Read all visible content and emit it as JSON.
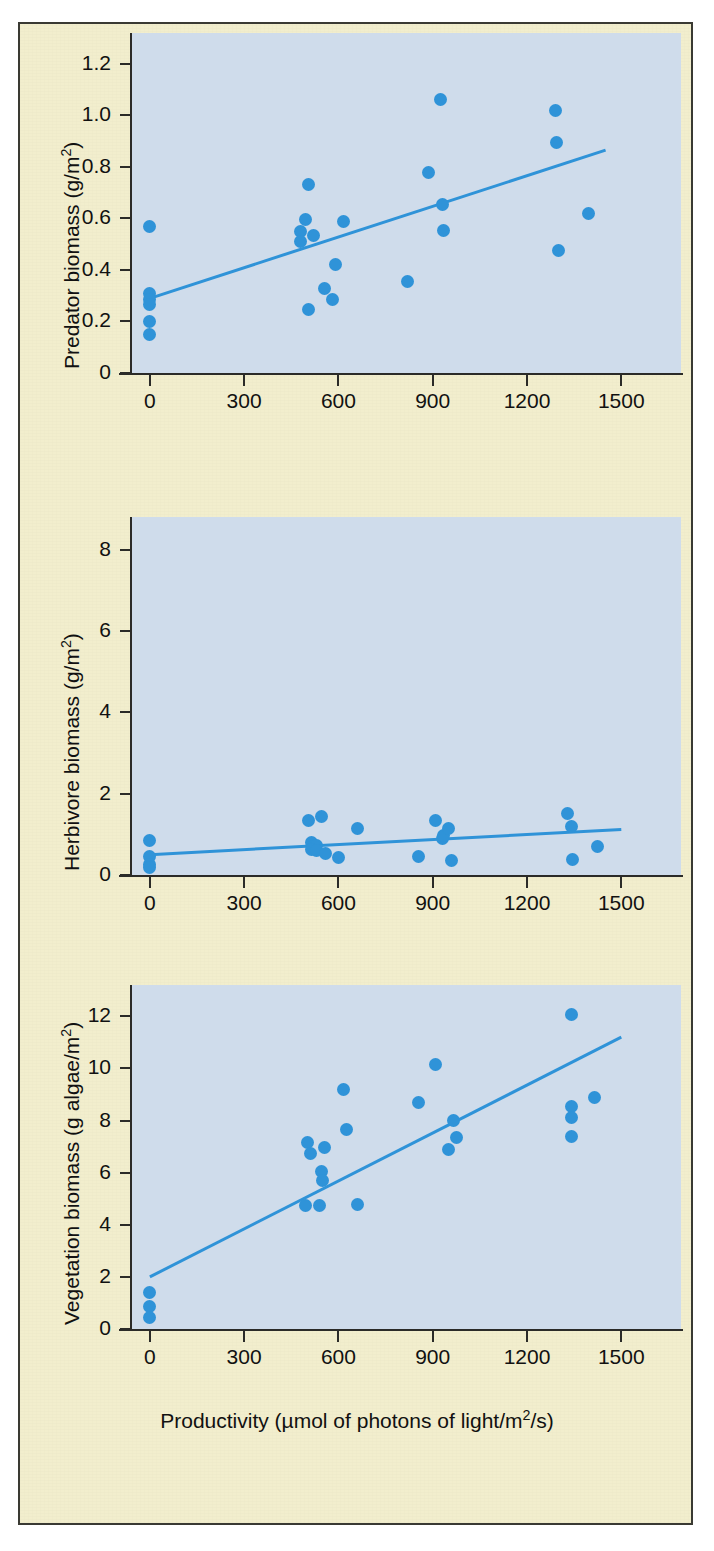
{
  "figure": {
    "background_color": "#f2eecd",
    "plot_background_color": "#cfdceb",
    "accent_color": "#2f93d8",
    "axis_color": "#2b2b28",
    "shared_xlabel": "Productivity (µmol of photons of light/m²/s)"
  },
  "chart_data": [
    {
      "type": "scatter",
      "title": "",
      "xlabel": "Productivity (µmol of photons of light/m²/s)",
      "ylabel": "Predator biomass (g/m²)",
      "ylabel_prefix": "Predator biomass (g/m",
      "ylabel_sup": "2",
      "ylabel_suffix": ")",
      "xlim": [
        -60,
        1690
      ],
      "ylim": [
        0,
        1.32
      ],
      "xticks": [
        0,
        300,
        600,
        900,
        1200,
        1500
      ],
      "xticklabels": [
        "0",
        "300",
        "600",
        "900",
        "1200",
        "1500"
      ],
      "yticks": [
        0,
        0.2,
        0.4,
        0.6,
        0.8,
        1.0,
        1.2
      ],
      "yticklabels": [
        "0",
        "0.2",
        "0.4",
        "0.6",
        "0.8",
        "1.0",
        "1.2"
      ],
      "grid": false,
      "legend": "none",
      "points": [
        [
          0,
          0.57
        ],
        [
          0,
          0.31
        ],
        [
          0,
          0.285
        ],
        [
          0,
          0.265
        ],
        [
          0,
          0.2
        ],
        [
          0,
          0.15
        ],
        [
          480,
          0.55
        ],
        [
          480,
          0.51
        ],
        [
          495,
          0.595
        ],
        [
          505,
          0.245
        ],
        [
          520,
          0.535
        ],
        [
          505,
          0.73
        ],
        [
          555,
          0.33
        ],
        [
          580,
          0.285
        ],
        [
          590,
          0.42
        ],
        [
          615,
          0.59
        ],
        [
          820,
          0.355
        ],
        [
          885,
          0.78
        ],
        [
          925,
          1.06
        ],
        [
          930,
          0.655
        ],
        [
          935,
          0.555
        ],
        [
          1290,
          1.02
        ],
        [
          1295,
          0.895
        ],
        [
          1300,
          0.475
        ],
        [
          1395,
          0.62
        ]
      ],
      "fit_line": {
        "x0": 0,
        "y0": 0.29,
        "x1": 1450,
        "y1": 0.865
      }
    },
    {
      "type": "scatter",
      "title": "",
      "xlabel": "Productivity (µmol of photons of light/m²/s)",
      "ylabel": "Herbivore biomass (g/m²)",
      "ylabel_prefix": "Herbivore biomass (g/m",
      "ylabel_sup": "2",
      "ylabel_suffix": ")",
      "xlim": [
        -60,
        1690
      ],
      "ylim": [
        0,
        8.8
      ],
      "xticks": [
        0,
        300,
        600,
        900,
        1200,
        1500
      ],
      "xticklabels": [
        "0",
        "300",
        "600",
        "900",
        "1200",
        "1500"
      ],
      "yticks": [
        0,
        2,
        4,
        6,
        8
      ],
      "yticklabels": [
        "0",
        "2",
        "4",
        "6",
        "8"
      ],
      "grid": false,
      "legend": "none",
      "points": [
        [
          0,
          0.85
        ],
        [
          0,
          0.45
        ],
        [
          0,
          0.25
        ],
        [
          0,
          0.18
        ],
        [
          505,
          1.35
        ],
        [
          545,
          1.45
        ],
        [
          515,
          0.8
        ],
        [
          520,
          0.7
        ],
        [
          530,
          0.72
        ],
        [
          515,
          0.62
        ],
        [
          530,
          0.6
        ],
        [
          560,
          0.52
        ],
        [
          600,
          0.42
        ],
        [
          660,
          1.15
        ],
        [
          855,
          0.45
        ],
        [
          910,
          1.35
        ],
        [
          930,
          0.9
        ],
        [
          935,
          0.97
        ],
        [
          950,
          1.15
        ],
        [
          960,
          0.35
        ],
        [
          1330,
          1.5
        ],
        [
          1340,
          1.18
        ],
        [
          1345,
          0.38
        ],
        [
          1425,
          0.7
        ]
      ],
      "fit_line": {
        "x0": 0,
        "y0": 0.5,
        "x1": 1500,
        "y1": 1.12
      }
    },
    {
      "type": "scatter",
      "title": "",
      "xlabel": "Productivity (µmol of photons of light/m²/s)",
      "ylabel": "Vegetation biomass (g algae/m²)",
      "ylabel_prefix": "Vegetation biomass (g algae/m",
      "ylabel_sup": "2",
      "ylabel_suffix": ")",
      "xlim": [
        -60,
        1690
      ],
      "ylim": [
        0,
        13.2
      ],
      "xticks": [
        0,
        300,
        600,
        900,
        1200,
        1500
      ],
      "xticklabels": [
        "0",
        "300",
        "600",
        "900",
        "1200",
        "1500"
      ],
      "yticks": [
        0,
        2,
        4,
        6,
        8,
        10,
        12
      ],
      "yticklabels": [
        "0",
        "2",
        "4",
        "6",
        "8",
        "10",
        "12"
      ],
      "grid": false,
      "legend": "none",
      "points": [
        [
          0,
          1.4
        ],
        [
          0,
          0.85
        ],
        [
          0,
          0.45
        ],
        [
          500,
          7.15
        ],
        [
          510,
          6.75
        ],
        [
          495,
          4.75
        ],
        [
          540,
          4.75
        ],
        [
          545,
          6.05
        ],
        [
          550,
          5.7
        ],
        [
          555,
          6.95
        ],
        [
          615,
          9.2
        ],
        [
          625,
          7.65
        ],
        [
          660,
          4.78
        ],
        [
          855,
          8.7
        ],
        [
          910,
          10.15
        ],
        [
          950,
          6.9
        ],
        [
          965,
          8.0
        ],
        [
          975,
          7.35
        ],
        [
          1340,
          12.05
        ],
        [
          1340,
          8.55
        ],
        [
          1340,
          8.1
        ],
        [
          1340,
          7.4
        ],
        [
          1415,
          8.9
        ]
      ],
      "fit_line": {
        "x0": 0,
        "y0": 2.0,
        "x1": 1500,
        "y1": 11.2
      }
    }
  ]
}
